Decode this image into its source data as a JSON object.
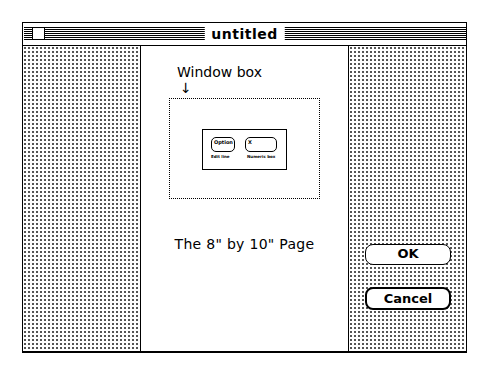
{
  "window": {
    "title": "untitled"
  },
  "page": {
    "window_box_label": "Window box",
    "arrow_glyph": "↓",
    "caption": "The 8\" by 10\" Page",
    "mini_dialog": {
      "fields": [
        {
          "text": "Option",
          "caption": "Edit line"
        },
        {
          "text": "X",
          "caption": "Numeric box"
        }
      ]
    }
  },
  "buttons": {
    "ok_label": "OK",
    "cancel_label": "Cancel"
  },
  "icons": {
    "close_box": "close-box-icon",
    "arrow": "down-arrow-icon"
  }
}
